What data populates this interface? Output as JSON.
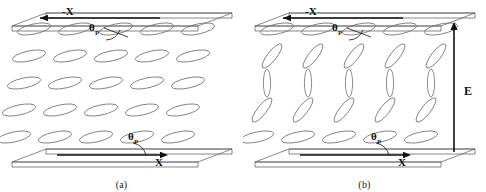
{
  "figure": {
    "type": "liquid-crystal-director-schematic",
    "background": "#ffffff",
    "molecule_stroke": "#6f6f6f",
    "plate_stroke": "#555555",
    "axis_stroke": "#111111"
  },
  "panels": [
    {
      "id": "a",
      "caption": "(a)",
      "state": "no applied field",
      "top_axis_label": "-X",
      "top_axis_arrow": "left",
      "bottom_axis_label": "X",
      "bottom_axis_arrow": "right",
      "top_angle_label": "θ",
      "top_angle_subscript": "p",
      "bottom_angle_label": "θ",
      "bottom_angle_subscript": "p",
      "field_label": "",
      "rows": 5,
      "columns": 5,
      "row_tilt_degrees": [
        -12,
        -12,
        -12,
        -12,
        -12
      ],
      "row_ellipse_rx": [
        17,
        17,
        17,
        17,
        17
      ],
      "row_ellipse_ry": [
        5.0,
        5.0,
        5.0,
        5.0,
        5.0
      ]
    },
    {
      "id": "b",
      "caption": "(b)",
      "state": "electric field applied",
      "top_axis_label": "-X",
      "top_axis_arrow": "left",
      "bottom_axis_label": "X",
      "bottom_axis_arrow": "right",
      "top_angle_label": "θ",
      "top_angle_subscript": "p",
      "bottom_angle_label": "θ",
      "bottom_angle_subscript": "p",
      "field_label": "E",
      "field_arrow": "up",
      "rows": 5,
      "columns": 5,
      "row_tilt_degrees": [
        -12,
        -52,
        -90,
        -52,
        -12
      ],
      "row_ellipse_rx": [
        17,
        15,
        14,
        15,
        17
      ],
      "row_ellipse_ry": [
        5.0,
        4.6,
        3.6,
        4.6,
        5.0
      ]
    }
  ],
  "geometry": {
    "column_count": 5,
    "column_spacing": 41,
    "column_start_x": 34,
    "row_count": 5,
    "row_spacing": 27,
    "row_start_y": 29,
    "row_skew_x": -5,
    "plate_depth_x": 34,
    "plate_depth_y": 13,
    "plate_width": 186
  },
  "chart_data": {
    "type": "scatter",
    "title": "",
    "xlabel": "X",
    "ylabel": "E",
    "series": [
      {
        "name": "panel-a-director-tilt",
        "categories": [
          "row1",
          "row2",
          "row3",
          "row4",
          "row5"
        ],
        "values": [
          -12,
          -12,
          -12,
          -12,
          -12
        ]
      },
      {
        "name": "panel-b-director-tilt",
        "categories": [
          "row1",
          "row2",
          "row3",
          "row4",
          "row5"
        ],
        "values": [
          -12,
          -52,
          -90,
          -52,
          -12
        ]
      }
    ],
    "legend_position": "none",
    "grid": false
  }
}
